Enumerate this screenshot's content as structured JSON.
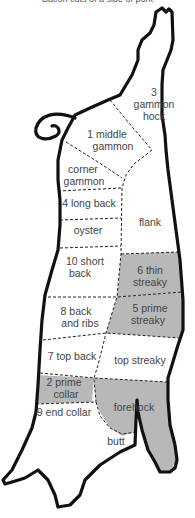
{
  "diagram": {
    "title_cut_off": "Bacon cuts of a side of pork",
    "shade_color": "#b8b8b8",
    "outline_color": "#111111",
    "text_color": "#444444",
    "labels": {
      "gammon_hock_1": "3",
      "gammon_hock_2": "gammon",
      "gammon_hock_3": "hock",
      "middle_gammon_1": "1 middle",
      "middle_gammon_2": "gammon",
      "corner_gammon_1": "corner",
      "corner_gammon_2": "gammon",
      "long_back": "4 long back",
      "flank": "flank",
      "oyster": "oyster",
      "short_back_1": "10 short",
      "short_back_2": "back",
      "thin_streaky_1": "6 thin",
      "thin_streaky_2": "streaky",
      "back_ribs_1": "8 back",
      "back_ribs_2": "and ribs",
      "prime_streaky_1": "5 prime",
      "prime_streaky_2": "streaky",
      "top_back": "7 top back",
      "top_streaky": "top streaky",
      "prime_collar_1": "2 prime",
      "prime_collar_2": "collar",
      "end_collar": "9 end collar",
      "forehock": "forehock",
      "butt": "butt"
    },
    "shaded_regions": [
      "6 thin streaky",
      "5 prime streaky",
      "2 prime collar",
      "forehock"
    ]
  }
}
